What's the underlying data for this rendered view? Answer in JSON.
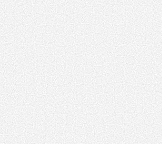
{
  "image": {
    "description": "Uniform light-gray static noise texture",
    "base_color": "#e2e2e2",
    "background_color": "#ffffff"
  }
}
